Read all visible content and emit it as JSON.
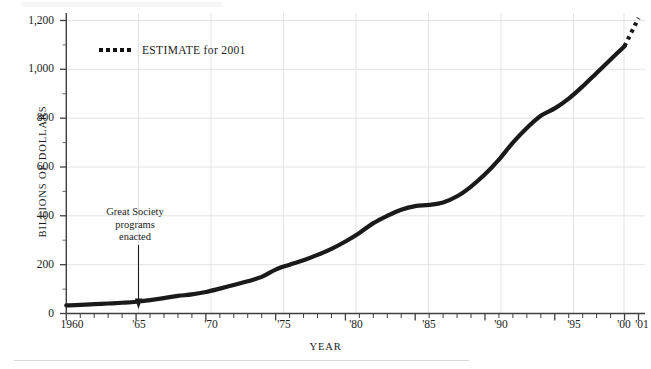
{
  "chart_data": {
    "type": "line",
    "title": "",
    "xlabel": "YEAR",
    "ylabel": "BILLIONS OF DOLLARS",
    "xlim": [
      1960,
      2001
    ],
    "ylim": [
      0,
      1200
    ],
    "grid": true,
    "legend_position": "top-left-inside",
    "legend": [
      {
        "name": "ESTIMATE for 2001",
        "style": "dotted"
      }
    ],
    "ytick_labels": [
      "0",
      "200",
      "400",
      "600",
      "800",
      "1,000",
      "1,200"
    ],
    "ytick_values": [
      0,
      200,
      400,
      600,
      800,
      1000,
      1200
    ],
    "xtick_labels": [
      "1960",
      "'65",
      "'70",
      "'75",
      "'80",
      "'85",
      "'90",
      "'95",
      "'00",
      "'01"
    ],
    "xtick_values": [
      1960,
      1965,
      1970,
      1975,
      1980,
      1985,
      1990,
      1995,
      2000,
      2001
    ],
    "minor_xtick_interval": 1,
    "annotations": [
      {
        "text": "Great Society\nprograms\nenacted",
        "line1": "Great Society",
        "line2": "programs",
        "line3": "enacted",
        "points_to_year": 1965,
        "points_to_value": 50,
        "arrow": "down"
      }
    ],
    "series": [
      {
        "name": "Actual",
        "style": "solid",
        "x": [
          1960,
          1961,
          1962,
          1963,
          1964,
          1965,
          1966,
          1967,
          1968,
          1969,
          1970,
          1971,
          1972,
          1973,
          1974,
          1975,
          1976,
          1977,
          1978,
          1979,
          1980,
          1981,
          1982,
          1983,
          1984,
          1985,
          1986,
          1987,
          1988,
          1989,
          1990,
          1991,
          1992,
          1993,
          1994,
          1995,
          1996,
          1997,
          1998,
          1999,
          2000
        ],
        "values": [
          33,
          35,
          38,
          41,
          44,
          48,
          55,
          63,
          72,
          78,
          88,
          102,
          117,
          132,
          150,
          180,
          200,
          218,
          240,
          265,
          295,
          330,
          370,
          400,
          425,
          440,
          445,
          455,
          480,
          520,
          570,
          630,
          700,
          760,
          810,
          840,
          880,
          930,
          985,
          1040,
          1095
        ]
      },
      {
        "name": "ESTIMATE for 2001",
        "style": "dotted",
        "x": [
          2000,
          2001
        ],
        "values": [
          1095,
          1210
        ]
      }
    ],
    "colors": {
      "line": "#1a1a1a",
      "grid": "#e3e3e3",
      "axis": "#4a4a4a",
      "background": "#ffffff",
      "text": "#1c1c1c"
    }
  }
}
